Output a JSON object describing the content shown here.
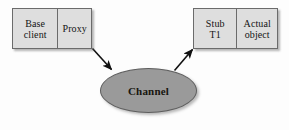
{
  "diagram": {
    "background_color": "#fdfdfd",
    "node_fill": "#dedede",
    "node_border": "#6b6b6b",
    "channel_fill": "#9a9a9a",
    "channel_border": "#5e5e5e",
    "arrow_color": "#111111",
    "client_group": {
      "base_client": "Base\nclient",
      "base_client_line1": "Base",
      "base_client_line2": "client",
      "proxy": "Proxy"
    },
    "server_group": {
      "stub_line1": "Stub",
      "stub_line2": "T1",
      "actual_object_line1": "Actual",
      "actual_object_line2": "object"
    },
    "channel": {
      "label": "Channel"
    },
    "edges": [
      {
        "name": "proxy-to-channel",
        "from": "Proxy",
        "to": "Channel",
        "direction": "down-right",
        "label": "",
        "arrowhead": "end"
      },
      {
        "name": "channel-to-stub",
        "from": "Channel",
        "to": "Stub T1",
        "direction": "up-right",
        "label": "",
        "arrowhead": "end"
      }
    ]
  }
}
